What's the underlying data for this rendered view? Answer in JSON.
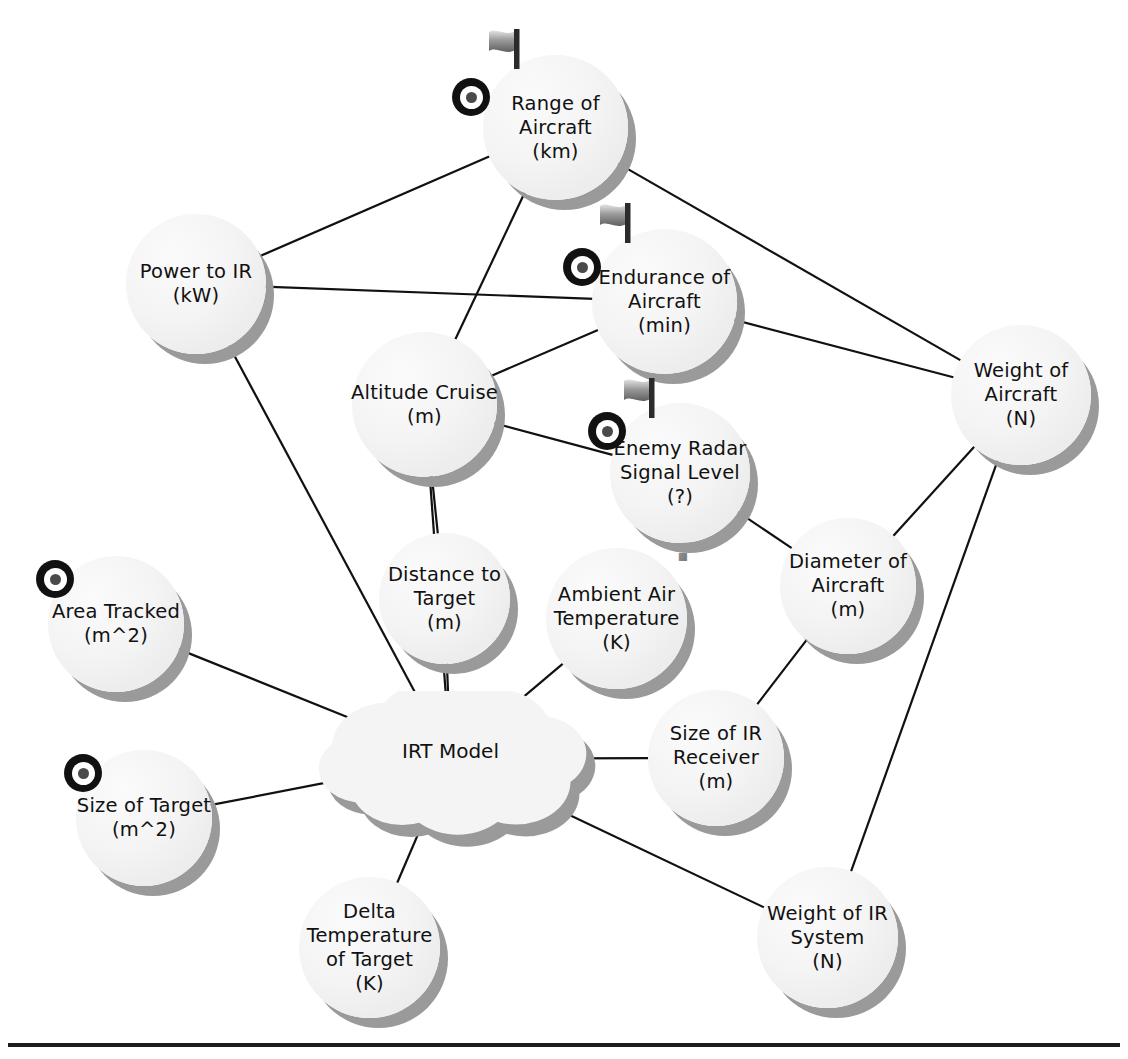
{
  "diagram": {
    "background": "#ffffff",
    "edge_color": "#111111",
    "node_fill": "#f2f2f2",
    "node_shadow": "#9a9a9a",
    "text_color": "#111111"
  },
  "nodes": [
    {
      "id": "range-of-aircraft",
      "name": "Range of Aircraft",
      "lines": [
        "Range of",
        "Aircraft",
        "(km)"
      ],
      "unit": "km",
      "shape": "circle",
      "x": 483,
      "y": 55,
      "w": 145,
      "h": 145,
      "icons": [
        "bullseye-icon",
        "flag-icon"
      ],
      "icon_positions": {
        "bullseye": {
          "x": 452,
          "y": 78
        },
        "flag": {
          "x": 481,
          "y": 24
        }
      }
    },
    {
      "id": "power-to-ir",
      "name": "Power to IR",
      "lines": [
        "Power to IR",
        "(kW)"
      ],
      "unit": "kW",
      "shape": "circle",
      "x": 126,
      "y": 214,
      "w": 140,
      "h": 140,
      "icons": []
    },
    {
      "id": "endurance-of-aircraft",
      "name": "Endurance of Aircraft",
      "lines": [
        "Endurance of",
        "Aircraft",
        "(min)"
      ],
      "unit": "min",
      "shape": "circle",
      "x": 592,
      "y": 229,
      "w": 145,
      "h": 145,
      "icons": [
        "bullseye-icon",
        "flag-icon"
      ],
      "icon_positions": {
        "bullseye": {
          "x": 563,
          "y": 248
        },
        "flag": {
          "x": 592,
          "y": 198
        }
      }
    },
    {
      "id": "weight-of-aircraft",
      "name": "Weight of Aircraft",
      "lines": [
        "Weight  of",
        "Aircraft",
        "(N)"
      ],
      "unit": "N",
      "shape": "circle",
      "x": 951,
      "y": 325,
      "w": 140,
      "h": 140,
      "icons": []
    },
    {
      "id": "altitude-cruise",
      "name": "Altitude Cruise",
      "lines": [
        "Altitude Cruise",
        "(m)"
      ],
      "unit": "m",
      "shape": "circle",
      "x": 352,
      "y": 332,
      "w": 145,
      "h": 145,
      "icons": []
    },
    {
      "id": "enemy-radar-signal-level",
      "name": "Enemy Radar Signal Level",
      "lines": [
        "Enemy Radar",
        "Signal Level",
        "(?)"
      ],
      "unit": "?",
      "shape": "circle",
      "x": 610,
      "y": 403,
      "w": 140,
      "h": 140,
      "icons": [
        "bullseye-icon",
        "flag-icon",
        "question-mark-icon"
      ],
      "icon_positions": {
        "bullseye": {
          "x": 588,
          "y": 412
        },
        "flag": {
          "x": 616,
          "y": 373
        },
        "question": {
          "x": 663,
          "y": 519
        }
      }
    },
    {
      "id": "distance-to-target",
      "name": "Distance to Target",
      "lines": [
        "Distance to",
        "Target",
        "(m)"
      ],
      "unit": "m",
      "shape": "circle",
      "x": 379,
      "y": 533,
      "w": 131,
      "h": 131,
      "icons": []
    },
    {
      "id": "ambient-air-temperature",
      "name": "Ambient Air Temperature",
      "lines": [
        "Ambient Air",
        "Temperature",
        "(K)"
      ],
      "unit": "K",
      "shape": "circle",
      "x": 546,
      "y": 548,
      "w": 141,
      "h": 141,
      "icons": []
    },
    {
      "id": "diameter-of-aircraft",
      "name": "Diameter of Aircraft",
      "lines": [
        "Diameter of",
        "Aircraft",
        "(m)"
      ],
      "unit": "m",
      "shape": "circle",
      "x": 780,
      "y": 518,
      "w": 136,
      "h": 136,
      "icons": []
    },
    {
      "id": "area-tracked",
      "name": "Area Tracked",
      "lines": [
        "Area Tracked",
        "(m^2)"
      ],
      "unit": "m^2",
      "shape": "circle",
      "x": 48,
      "y": 556,
      "w": 136,
      "h": 136,
      "icons": [
        "bullseye-icon"
      ],
      "icon_positions": {
        "bullseye": {
          "x": 36,
          "y": 560
        }
      }
    },
    {
      "id": "irt-model",
      "name": "IRT Model",
      "lines": [
        "IRT Model"
      ],
      "unit": "",
      "shape": "cloud",
      "x": 318,
      "y": 691,
      "w": 265,
      "h": 135,
      "icons": []
    },
    {
      "id": "size-of-ir-receiver",
      "name": "Size of IR Receiver",
      "lines": [
        "Size of IR",
        "Receiver",
        "(m)"
      ],
      "unit": "m",
      "shape": "circle",
      "x": 648,
      "y": 690,
      "w": 136,
      "h": 136,
      "icons": []
    },
    {
      "id": "size-of-target",
      "name": "Size of Target",
      "lines": [
        "Size of Target",
        "(m^2)"
      ],
      "unit": "m^2",
      "shape": "circle",
      "x": 76,
      "y": 750,
      "w": 136,
      "h": 136,
      "icons": [
        "bullseye-icon"
      ],
      "icon_positions": {
        "bullseye": {
          "x": 64,
          "y": 754
        }
      }
    },
    {
      "id": "weight-of-ir-system",
      "name": "Weight of IR System",
      "lines": [
        "Weight of IR",
        "System",
        "(N)"
      ],
      "unit": "N",
      "shape": "circle",
      "x": 757,
      "y": 867,
      "w": 141,
      "h": 141,
      "icons": []
    },
    {
      "id": "delta-temperature-of-target",
      "name": "Delta Temperature of Target",
      "lines": [
        "Delta",
        "Temperature",
        "of Target",
        "(K)"
      ],
      "unit": "K",
      "shape": "circle",
      "x": 299,
      "y": 877,
      "w": 141,
      "h": 141,
      "icons": []
    }
  ],
  "edges": [
    {
      "from": "power-to-ir",
      "to": "range-of-aircraft"
    },
    {
      "from": "power-to-ir",
      "to": "endurance-of-aircraft"
    },
    {
      "from": "power-to-ir",
      "to": "irt-model"
    },
    {
      "from": "range-of-aircraft",
      "to": "altitude-cruise"
    },
    {
      "from": "range-of-aircraft",
      "to": "weight-of-aircraft"
    },
    {
      "from": "endurance-of-aircraft",
      "to": "altitude-cruise"
    },
    {
      "from": "endurance-of-aircraft",
      "to": "weight-of-aircraft"
    },
    {
      "from": "altitude-cruise",
      "to": "enemy-radar-signal-level"
    },
    {
      "from": "altitude-cruise",
      "to": "distance-to-target"
    },
    {
      "from": "altitude-cruise",
      "to": "irt-model"
    },
    {
      "from": "enemy-radar-signal-level",
      "to": "diameter-of-aircraft"
    },
    {
      "from": "weight-of-aircraft",
      "to": "diameter-of-aircraft"
    },
    {
      "from": "weight-of-aircraft",
      "to": "weight-of-ir-system"
    },
    {
      "from": "diameter-of-aircraft",
      "to": "size-of-ir-receiver"
    },
    {
      "from": "distance-to-target",
      "to": "irt-model"
    },
    {
      "from": "ambient-air-temperature",
      "to": "irt-model"
    },
    {
      "from": "area-tracked",
      "to": "irt-model"
    },
    {
      "from": "size-of-target",
      "to": "irt-model"
    },
    {
      "from": "irt-model",
      "to": "size-of-ir-receiver"
    },
    {
      "from": "irt-model",
      "to": "weight-of-ir-system"
    },
    {
      "from": "irt-model",
      "to": "delta-temperature-of-target"
    }
  ],
  "icons": {
    "bullseye-icon": {
      "label": "target-marker",
      "meaning": "requirement / metric marker"
    },
    "flag-icon": {
      "label": "flag-marker",
      "meaning": "flagged attribute"
    },
    "question-mark-icon": {
      "label": "question-marker",
      "meaning": "unknown unit"
    }
  },
  "bottom_rule": {
    "y": 1043,
    "color": "#1c1c1c"
  }
}
